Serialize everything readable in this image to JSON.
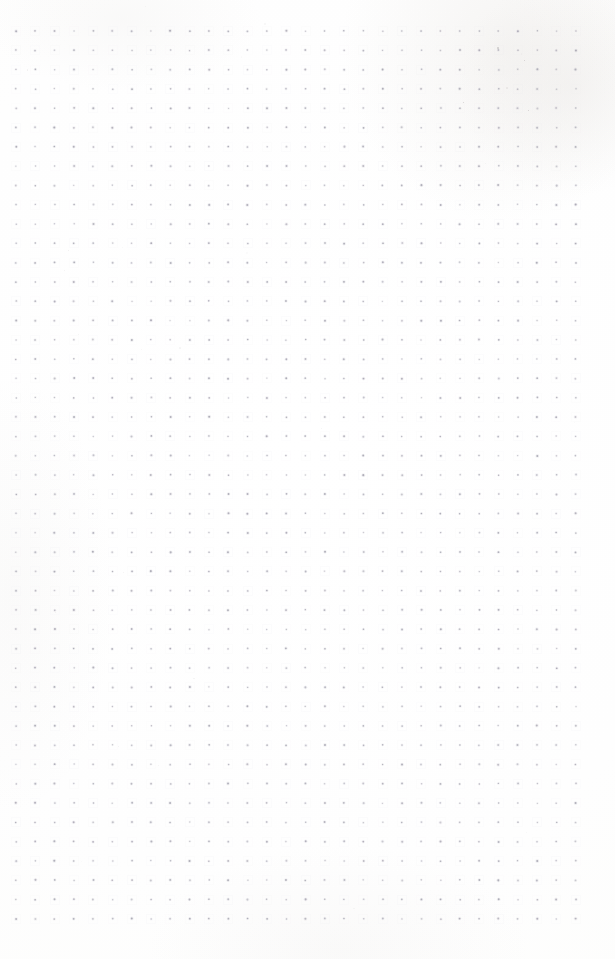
{
  "page": {
    "kind": "blank-dot-grid-scan",
    "width_px": 615,
    "height_px": 959,
    "background_color": "#fefefe",
    "paper_tone": "white",
    "content_text": "",
    "notes_present": "false"
  },
  "grid": {
    "label": "dot-grid",
    "dot_color": "#b7b6bf",
    "dot_halo_color": "#eceaf0",
    "dot_diameter_px": 1.6,
    "spacing_x_px": 19.3,
    "spacing_y_px": 19.3,
    "origin_x_px": 16,
    "origin_y_px": 31,
    "columns": 30,
    "rows": 47,
    "last_dot_x_px": 575,
    "last_dot_y_px": 918,
    "margin_left_px": 16,
    "margin_top_px": 31,
    "margin_right_px": 40,
    "margin_bottom_px": 41
  },
  "artifacts": {
    "label": "scan-artifacts",
    "description": "faint tonal smudges near the upper right corner and sparse dust specks",
    "tint_color": "#cdc6be",
    "speck_color": "#aaa5a5",
    "regions": [
      "top-right",
      "top-center",
      "bottom-center",
      "left-middle"
    ]
  }
}
